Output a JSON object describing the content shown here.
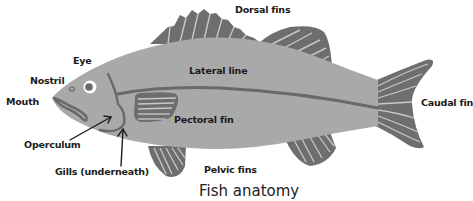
{
  "title": "Fish anatomy",
  "colors": {
    "body": "#a9a9a9",
    "fin": "#6e6e6e",
    "fin_rays": "#c8c8c8",
    "outline": "#6a6a6a",
    "label": "#1a1a1a",
    "background": "#ffffff"
  },
  "labels": {
    "dorsal_fins": "Dorsal fins",
    "eye": "Eye",
    "nostril": "Nostril",
    "mouth": "Mouth",
    "lateral_line": "Lateral line",
    "caudal_fin": "Caudal fin",
    "pectoral_fin": "Pectoral fin",
    "operculum": "Operculum",
    "gills": "Gills (underneath)",
    "pelvic_fins": "Pelvic fins"
  }
}
